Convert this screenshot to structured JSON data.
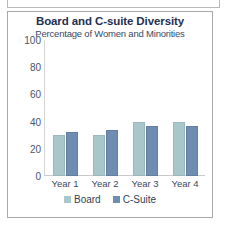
{
  "chart_data": {
    "type": "bar",
    "title": "Board and C-suite Diversity",
    "subtitle": "Percentage of Women and Minorities",
    "xlabel": "",
    "ylabel": "",
    "ylim": [
      0,
      100
    ],
    "yticks": [
      0,
      20,
      40,
      60,
      80,
      100
    ],
    "ytick_labels": [
      "0",
      "20",
      "40",
      "60",
      "80",
      "100"
    ],
    "categories": [
      "Year 1",
      "Year 2",
      "Year 3",
      "Year 4"
    ],
    "grid": false,
    "legend_position": "bottom-center",
    "series": [
      {
        "name": "Board",
        "color": "#a9c6cb",
        "values": [
          30,
          30,
          40,
          40
        ]
      },
      {
        "name": "C-Suite",
        "color": "#6f8cb3",
        "values": [
          32,
          34,
          37,
          37
        ]
      }
    ]
  },
  "frame": {
    "border_color": "#a9a9a9",
    "background": "#ffffff"
  }
}
